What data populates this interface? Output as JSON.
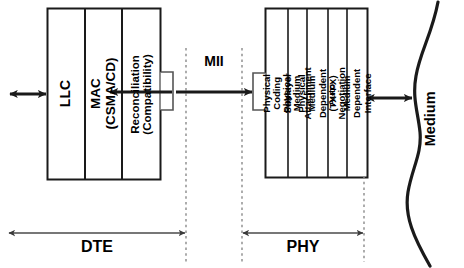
{
  "diagram": {
    "stroke_color": "#1a1a1a",
    "background_color": "#ffffff"
  },
  "dte_stack": {
    "name": "DTE",
    "layers": [
      {
        "id": "llc",
        "label": "LLC"
      },
      {
        "id": "mac",
        "label": "MAC (CSMA/CD)"
      },
      {
        "id": "reconciliation",
        "label": "Reconciliation\n(Compatibility)"
      }
    ]
  },
  "phy_stack": {
    "name": "PHY",
    "layers": [
      {
        "id": "pcs",
        "label": "Physical Coding Sublayer"
      },
      {
        "id": "pma",
        "label": "Physical Medium Attachment"
      },
      {
        "id": "pmd",
        "label": "Physical Medium Dependent (TX+FX)"
      },
      {
        "id": "autoneg",
        "label": "Auto-Negotiation"
      },
      {
        "id": "mdi",
        "label": "Medium Dependent Interface"
      }
    ]
  },
  "interfaces": {
    "mii_label": "MII",
    "medium_label": "Medium"
  },
  "span_labels": {
    "dte": "DTE",
    "phy": "PHY"
  },
  "connectors": {
    "upper_left_arrow": "bidirectional-arrow",
    "mii_arrow": "bidirectional-arrow",
    "medium_arrow": "bidirectional-arrow",
    "dte_span_arrow": "bidirectional-arrow",
    "phy_span_arrow": "bidirectional-arrow"
  }
}
